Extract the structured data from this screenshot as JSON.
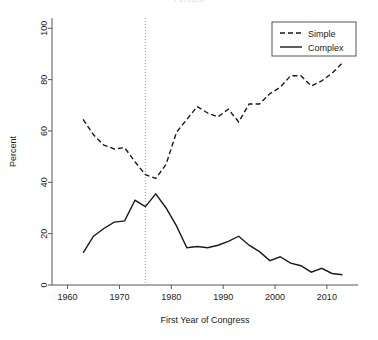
{
  "figure": {
    "title_clipped": "Percent",
    "background": "#ffffff",
    "foreground": "#1a1a1a",
    "refline_color": "#9a9a9a"
  },
  "legend": {
    "position": "top-right",
    "entries": [
      {
        "label": "Simple",
        "style": "dashed",
        "key": "legend-key-simple"
      },
      {
        "label": "Complex",
        "style": "solid",
        "key": "legend-key-complex"
      }
    ]
  },
  "axes": {
    "x": {
      "label": "First Year of Congress",
      "ticks": [
        "1960",
        "1970",
        "1980",
        "1990",
        "2000",
        "2010"
      ],
      "tick_values": [
        1960,
        1970,
        1980,
        1990,
        2000,
        2010
      ],
      "range": [
        1957,
        2016
      ]
    },
    "y": {
      "label": "Percent",
      "ticks": [
        "0",
        "20",
        "40",
        "60",
        "80",
        "100"
      ],
      "tick_values": [
        0,
        20,
        40,
        60,
        80,
        100
      ],
      "range": [
        0,
        104
      ]
    }
  },
  "annotations": [
    {
      "type": "vertical-reference-line",
      "x_value": 1975,
      "style": "dotted"
    }
  ],
  "chart_data": {
    "type": "line",
    "title": "Percent",
    "xlabel": "First Year of Congress",
    "ylabel": "Percent",
    "xlim": [
      1957,
      2016
    ],
    "ylim": [
      0,
      104
    ],
    "grid": false,
    "legend_position": "top right",
    "x": [
      1963,
      1965,
      1967,
      1969,
      1971,
      1973,
      1975,
      1977,
      1979,
      1981,
      1983,
      1985,
      1987,
      1989,
      1991,
      1993,
      1995,
      1997,
      1999,
      2001,
      2003,
      2005,
      2007,
      2009,
      2011,
      2013
    ],
    "series": [
      {
        "name": "Simple",
        "style": "dashed",
        "values": [
          64.5,
          58.5,
          54.5,
          53.0,
          53.5,
          48.0,
          43.0,
          41.5,
          47.0,
          59.5,
          64.5,
          69.5,
          67.0,
          65.5,
          68.5,
          63.5,
          70.5,
          70.5,
          74.5,
          77.0,
          81.5,
          81.5,
          77.5,
          79.5,
          82.5,
          86.5
        ]
      },
      {
        "name": "Complex",
        "style": "solid",
        "values": [
          12.5,
          19.0,
          22.0,
          24.5,
          25.0,
          33.0,
          30.5,
          35.5,
          30.0,
          23.0,
          14.5,
          15.0,
          14.5,
          15.5,
          17.0,
          19.0,
          15.5,
          13.0,
          9.5,
          11.0,
          8.5,
          7.5,
          5.0,
          6.5,
          4.5,
          4.0
        ]
      }
    ],
    "annotations": [
      {
        "type": "vline",
        "x": 1975,
        "style": "dotted",
        "color": "#9a9a9a"
      }
    ]
  }
}
